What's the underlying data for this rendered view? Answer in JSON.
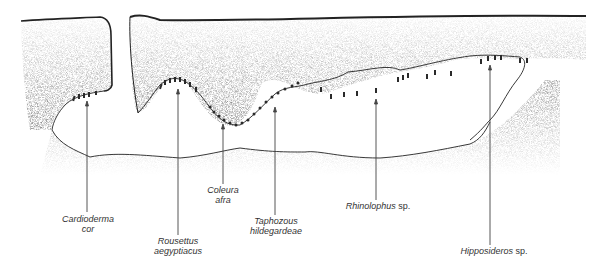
{
  "diagram": {
    "type": "cave-cross-section",
    "colors": {
      "rock_stipple": "#bdbdbd",
      "outline": "#222222",
      "arrow": "#444444",
      "bat": "#2a2a2a"
    },
    "labels": [
      {
        "id": "cardioderma",
        "line1": "Cardioderma",
        "line2": "cor",
        "suffix": ""
      },
      {
        "id": "rousettus",
        "line1": "Rousettus",
        "line2": "aegyptiacus",
        "suffix": ""
      },
      {
        "id": "coleura",
        "line1": "Coleura",
        "line2": "afra",
        "suffix": ""
      },
      {
        "id": "taphozous",
        "line1": "Taphozous",
        "line2": "hildegardeae",
        "suffix": ""
      },
      {
        "id": "rhinolophus",
        "line1": "Rhinolophus",
        "line2": "",
        "suffix": "sp."
      },
      {
        "id": "hipposideros",
        "line1": "Hipposideros",
        "line2": "",
        "suffix": "sp."
      }
    ]
  }
}
